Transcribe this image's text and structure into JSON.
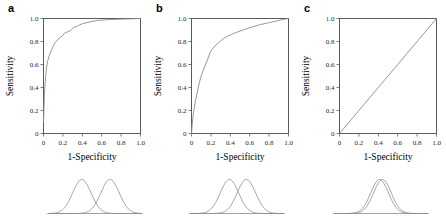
{
  "figure": {
    "panels": [
      {
        "letter": "a",
        "xlabel": "1-Specificity",
        "ylabel": "Sensitivity"
      },
      {
        "letter": "b",
        "xlabel": "1-Specificity",
        "ylabel": "Sensitivity"
      },
      {
        "letter": "c",
        "xlabel": "1-Specificity",
        "ylabel": "Sensitivity"
      }
    ]
  },
  "axis": {
    "xticks": [
      "0",
      "0.2",
      "0.4",
      "0.6",
      "0.8",
      "1.0"
    ],
    "yticks": [
      "0",
      "0.2",
      "0.4",
      "0.6",
      "0.8",
      "1.0"
    ]
  },
  "colors": {
    "curve": "#8c8c8c",
    "frame": "#5a5a5a",
    "text": "#1a1a1a"
  },
  "chart_data": [
    {
      "type": "line",
      "title": "a",
      "xlabel": "1-Specificity",
      "ylabel": "Sensitivity",
      "xlim": [
        0,
        1
      ],
      "ylim": [
        0,
        1
      ],
      "xticks": [
        0,
        0.2,
        0.4,
        0.6,
        0.8,
        1.0
      ],
      "yticks": [
        0,
        0.2,
        0.4,
        0.6,
        0.8,
        1.0
      ],
      "grid": false,
      "legend": "none",
      "series": [
        {
          "name": "ROC curve",
          "x": [
            0.0,
            0.005,
            0.01,
            0.02,
            0.03,
            0.04,
            0.06,
            0.08,
            0.1,
            0.12,
            0.15,
            0.18,
            0.2,
            0.22,
            0.25,
            0.28,
            0.31,
            0.35,
            0.4,
            0.45,
            0.5,
            0.58,
            0.66,
            0.75,
            0.85,
            1.0
          ],
          "y": [
            0.1,
            0.22,
            0.35,
            0.48,
            0.56,
            0.62,
            0.68,
            0.72,
            0.76,
            0.79,
            0.82,
            0.84,
            0.855,
            0.875,
            0.885,
            0.895,
            0.92,
            0.935,
            0.955,
            0.965,
            0.975,
            0.985,
            0.99,
            0.993,
            0.996,
            1.0
          ]
        }
      ]
    },
    {
      "type": "line",
      "title": "b",
      "xlabel": "1-Specificity",
      "ylabel": "Sensitivity",
      "xlim": [
        0,
        1
      ],
      "ylim": [
        0,
        1
      ],
      "xticks": [
        0,
        0.2,
        0.4,
        0.6,
        0.8,
        1.0
      ],
      "yticks": [
        0,
        0.2,
        0.4,
        0.6,
        0.8,
        1.0
      ],
      "grid": false,
      "legend": "none",
      "series": [
        {
          "name": "ROC curve",
          "x": [
            0.0,
            0.01,
            0.02,
            0.04,
            0.06,
            0.08,
            0.1,
            0.13,
            0.16,
            0.19,
            0.21,
            0.24,
            0.28,
            0.32,
            0.37,
            0.42,
            0.48,
            0.55,
            0.62,
            0.7,
            0.78,
            0.86,
            0.93,
            1.0
          ],
          "y": [
            0.0,
            0.1,
            0.18,
            0.28,
            0.36,
            0.44,
            0.5,
            0.57,
            0.63,
            0.7,
            0.73,
            0.76,
            0.79,
            0.82,
            0.845,
            0.865,
            0.885,
            0.905,
            0.925,
            0.945,
            0.96,
            0.975,
            0.99,
            1.0
          ]
        }
      ]
    },
    {
      "type": "line",
      "title": "c",
      "xlabel": "1-Specificity",
      "ylabel": "Sensitivity",
      "xlim": [
        0,
        1
      ],
      "ylim": [
        0,
        1
      ],
      "xticks": [
        0,
        0.2,
        0.4,
        0.6,
        0.8,
        1.0
      ],
      "yticks": [
        0,
        0.2,
        0.4,
        0.6,
        0.8,
        1.0
      ],
      "grid": false,
      "legend": "none",
      "series": [
        {
          "name": "ROC curve",
          "x": [
            0.0,
            1.0
          ],
          "y": [
            0.0,
            1.0
          ]
        }
      ]
    }
  ],
  "distribution_data": [
    {
      "panel": "a",
      "type": "line",
      "description": "Two normal distributions with small overlap",
      "curves": [
        {
          "name": "non-diseased",
          "mean": 0.36,
          "sd": 0.098
        },
        {
          "name": "diseased",
          "mean": 0.66,
          "sd": 0.098
        }
      ]
    },
    {
      "panel": "b",
      "type": "line",
      "description": "Two normal distributions with moderate overlap",
      "curves": [
        {
          "name": "non-diseased",
          "mean": 0.42,
          "sd": 0.098
        },
        {
          "name": "diseased",
          "mean": 0.6,
          "sd": 0.098
        }
      ]
    },
    {
      "panel": "c",
      "type": "line",
      "description": "Two normal distributions almost completely overlapping",
      "curves": [
        {
          "name": "non-diseased",
          "mean": 0.485,
          "sd": 0.094
        },
        {
          "name": "diseased",
          "mean": 0.515,
          "sd": 0.094
        }
      ]
    }
  ]
}
